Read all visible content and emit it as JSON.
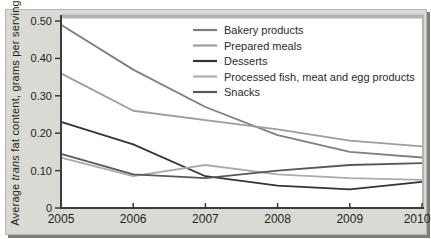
{
  "figure": {
    "panel_background": "#d9dad4",
    "plot_background": "#ffffff",
    "frame_shadow_color": "#7e7f78",
    "axis_color": "#3c3c3c",
    "frame_color": "#b3b4ae"
  },
  "chart_data": {
    "type": "line",
    "title": "",
    "xlabel": "",
    "ylabel": "Average trans fat content, grams per serving",
    "ylabel_parts": {
      "prefix": "Average ",
      "italic": "trans",
      "suffix": " fat content, grams per serving"
    },
    "x": [
      2005,
      2006,
      2007,
      2008,
      2009,
      2010
    ],
    "x_tick_labels": [
      "2005",
      "2006",
      "2007",
      "2008",
      "2009",
      "2010"
    ],
    "y_ticks": [
      0,
      0.1,
      0.2,
      0.3,
      0.4,
      0.5
    ],
    "y_tick_labels": [
      "0",
      "0.10",
      "0.20",
      "0.30",
      "0.40",
      "0.50"
    ],
    "ylim": [
      0,
      0.5
    ],
    "grid": false,
    "legend_position": "inside-top-center",
    "series": [
      {
        "name": "Bakery products",
        "color": "#7f7f7f",
        "values": [
          0.49,
          0.37,
          0.27,
          0.195,
          0.15,
          0.135
        ]
      },
      {
        "name": "Prepared meals",
        "color": "#9d9d9d",
        "values": [
          0.36,
          0.26,
          0.235,
          0.21,
          0.18,
          0.165
        ]
      },
      {
        "name": "Desserts",
        "color": "#343434",
        "values": [
          0.23,
          0.17,
          0.085,
          0.06,
          0.05,
          0.07
        ]
      },
      {
        "name": "Processed fish, meat and egg products",
        "color": "#ababab",
        "values": [
          0.135,
          0.085,
          0.115,
          0.09,
          0.08,
          0.075
        ]
      },
      {
        "name": "Snacks",
        "color": "#585858",
        "values": [
          0.145,
          0.09,
          0.08,
          0.1,
          0.115,
          0.12
        ]
      }
    ]
  }
}
